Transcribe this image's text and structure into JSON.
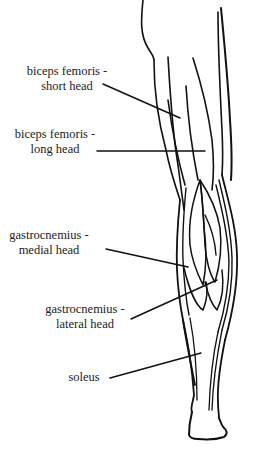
{
  "diagram": {
    "stroke_color": "#111111",
    "background": "#ffffff",
    "labels": [
      {
        "id": "biceps-femoris-short-head",
        "line1": "biceps femoris -",
        "line2": "short head"
      },
      {
        "id": "biceps-femoris-long-head",
        "line1": "biceps femoris -",
        "line2": "long head"
      },
      {
        "id": "gastrocnemius-medial-head",
        "line1": "gastrocnemius -",
        "line2": "medial head"
      },
      {
        "id": "gastrocnemius-lateral-head",
        "line1": "gastrocnemius -",
        "line2": "lateral head"
      },
      {
        "id": "soleus",
        "line1": "soleus",
        "line2": ""
      }
    ]
  }
}
